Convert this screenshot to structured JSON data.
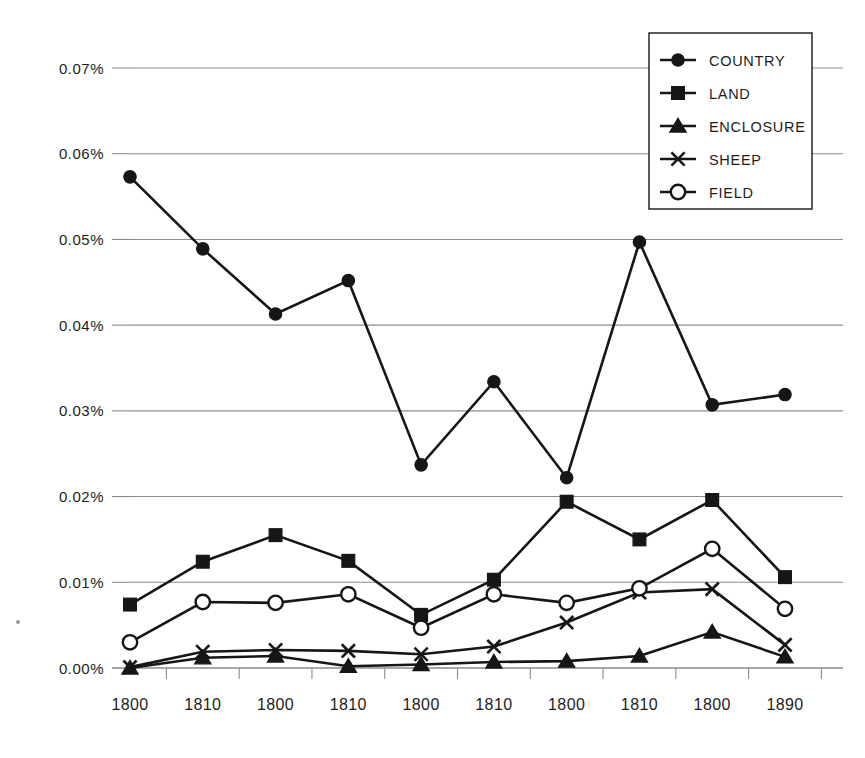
{
  "chart_data": {
    "type": "line",
    "title": "",
    "subtitle": "",
    "xlabel": "",
    "ylabel": "",
    "grid": "horizontal",
    "legend_position": "top-right",
    "ylim": [
      0.0,
      0.075
    ],
    "ytick_values": [
      0.0,
      0.01,
      0.02,
      0.03,
      0.04,
      0.05,
      0.06,
      0.07
    ],
    "ytick_labels": [
      "0.00%",
      "0.01%",
      "0.02%",
      "0.03%",
      "0.04%",
      "0.05%",
      "0.06%",
      "0.07%"
    ],
    "categories": [
      "1800",
      "1810",
      "1800",
      "1810",
      "1800",
      "1810",
      "1800",
      "1810",
      "1800",
      "1890"
    ],
    "series": [
      {
        "name": "COUNTRY",
        "marker": "filled-circle",
        "values": [
          0.0573,
          0.0489,
          0.0413,
          0.0452,
          0.0237,
          0.0334,
          0.0222,
          0.0497,
          0.0307,
          0.0319
        ]
      },
      {
        "name": "LAND",
        "marker": "filled-square",
        "values": [
          0.0074,
          0.0124,
          0.0155,
          0.0125,
          0.0062,
          0.0103,
          0.0194,
          0.015,
          0.0196,
          0.0106
        ]
      },
      {
        "name": "ENCLOSURE",
        "marker": "filled-triangle",
        "values": [
          0.0,
          0.0012,
          0.0014,
          0.0002,
          0.0004,
          0.0007,
          0.0008,
          0.0014,
          0.0042,
          0.0013
        ]
      },
      {
        "name": "SHEEP",
        "marker": "cross",
        "values": [
          0.0001,
          0.0019,
          0.0021,
          0.002,
          0.0016,
          0.0025,
          0.0053,
          0.0088,
          0.0092,
          0.0027
        ]
      },
      {
        "name": "FIELD",
        "marker": "open-circle",
        "values": [
          0.003,
          0.0077,
          0.0076,
          0.0086,
          0.0047,
          0.0086,
          0.0076,
          0.0093,
          0.0139,
          0.0069
        ]
      }
    ],
    "legend_entries": [
      {
        "label": "COUNTRY",
        "marker": "filled-circle"
      },
      {
        "label": "LAND",
        "marker": "filled-square"
      },
      {
        "label": "ENCLOSURE",
        "marker": "filled-triangle"
      },
      {
        "label": "SHEEP",
        "marker": "cross"
      },
      {
        "label": "FIELD",
        "marker": "open-circle"
      }
    ],
    "colors": {
      "series": "#161616",
      "grid": "#8c8c8c",
      "background": "#ffffff",
      "text": "#1d1d1d"
    }
  }
}
